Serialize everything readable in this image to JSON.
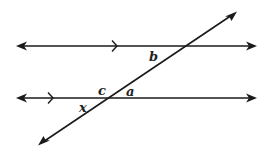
{
  "diagram": {
    "colors": {
      "line": "#1a1a1a",
      "label": "#222222",
      "background": "#ffffff"
    },
    "lines": [
      {
        "id": "top-parallel",
        "type": "line",
        "parallel_marker": "single-chevron"
      },
      {
        "id": "bottom-parallel",
        "type": "line",
        "parallel_marker": "single-chevron"
      },
      {
        "id": "transversal",
        "type": "line"
      }
    ],
    "labels": {
      "b": "b",
      "c": "c",
      "a": "a",
      "x": "x"
    },
    "angle_descriptions": {
      "b": "below top parallel line, left of transversal",
      "c": "above bottom parallel line, left of transversal",
      "a": "above bottom parallel line, right of transversal",
      "x": "below bottom parallel line, left of transversal"
    }
  }
}
